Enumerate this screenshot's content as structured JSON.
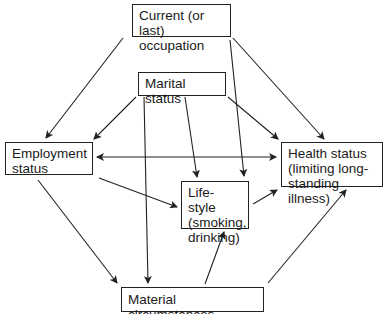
{
  "diagram": {
    "type": "causal-flow",
    "nodes": [
      {
        "id": "occupation",
        "label": "Current (or last)\noccupation"
      },
      {
        "id": "marital",
        "label": "Marital status"
      },
      {
        "id": "employment",
        "label": "Employment\nstatus"
      },
      {
        "id": "health",
        "label": "Health status\n(limiting long-\nstanding illness)"
      },
      {
        "id": "lifestyle",
        "label": "Life-style\n(smoking,\ndrinking)"
      },
      {
        "id": "material",
        "label": "Material circumstances"
      }
    ],
    "edges": [
      {
        "from": "occupation",
        "to": "employment"
      },
      {
        "from": "occupation",
        "to": "health"
      },
      {
        "from": "occupation",
        "to": "lifestyle"
      },
      {
        "from": "marital",
        "to": "employment"
      },
      {
        "from": "marital",
        "to": "health"
      },
      {
        "from": "marital",
        "to": "lifestyle"
      },
      {
        "from": "marital",
        "to": "material"
      },
      {
        "from": "employment",
        "to": "health",
        "bidirectional": true
      },
      {
        "from": "employment",
        "to": "lifestyle"
      },
      {
        "from": "employment",
        "to": "material"
      },
      {
        "from": "lifestyle",
        "to": "health"
      },
      {
        "from": "material",
        "to": "lifestyle"
      },
      {
        "from": "material",
        "to": "health"
      }
    ]
  }
}
